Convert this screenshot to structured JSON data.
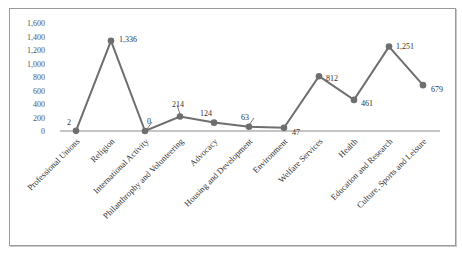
{
  "chart_data": {
    "type": "line",
    "title": "",
    "xlabel": "",
    "ylabel": "",
    "ylim": [
      0,
      1600
    ],
    "yticks": [
      0,
      200,
      400,
      600,
      800,
      1000,
      1200,
      1400,
      1600
    ],
    "ytick_labels": [
      "0",
      "200",
      "400",
      "600",
      "800",
      "1,000",
      "1,200",
      "1,400",
      "1,600"
    ],
    "grid": false,
    "legend": null,
    "categories": [
      "Professional Unions",
      "Religion",
      "International Activity",
      "Philanthrophy and Volunteering",
      "Advocacy",
      "Housing and Development",
      "Environment",
      "Welfare Services",
      "Health",
      "Education and Research",
      "Culture, Sports and Leisure"
    ],
    "values": [
      2,
      1336,
      0,
      214,
      124,
      63,
      47,
      812,
      461,
      1251,
      679
    ],
    "data_labels": [
      "2",
      "1,336",
      "0",
      "214",
      "124",
      "63",
      "47",
      "812",
      "461",
      "1,251",
      "679"
    ],
    "colors": {
      "line": "#6e6e6e",
      "marker": "#6e6e6e",
      "axis": "#8a8a8a"
    }
  }
}
